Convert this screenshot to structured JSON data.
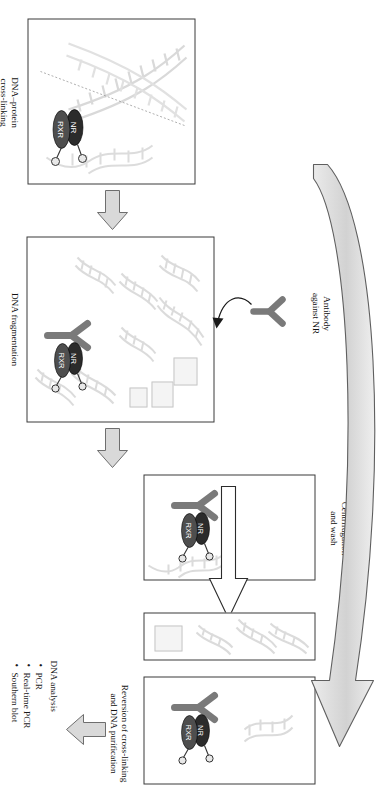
{
  "figure": {
    "orientation": "rotated-90-clockwise"
  },
  "steps": {
    "crosslinking": "DNA–protein\ncross-linking",
    "crosslinking_line1": "DNA–protein",
    "crosslinking_line2": "cross-linking",
    "fragmentation": "DNA fragmentation",
    "antibody_line1": "Antibody",
    "antibody_line2": "against NR",
    "centrifugation_line1": "Centrifugation",
    "centrifugation_line2": "and wash",
    "reversion_line1": "Reversion of cross-linking",
    "reversion_line2": "and DNA purification"
  },
  "analysis": {
    "heading": "DNA analysis",
    "items": [
      "PCR",
      "Real-time PCR",
      "Southern blot"
    ]
  },
  "complex": {
    "nr_label": "NR",
    "rxr_label": "RXR"
  },
  "icons": {
    "antibody": "antibody-y-icon",
    "dna_helix": "dna-helix-icon",
    "block_arrow": "block-arrow-icon",
    "curved_arrow": "curved-arrow-icon",
    "ligand": "ligand-circle-icon"
  },
  "colors": {
    "outline": "#3a3a3a",
    "arrow_fill": "#d9d9d9",
    "arrow_stroke": "#6b6b6b",
    "antibody": "#7a7a7a",
    "nr_oval": "#2b2b2b",
    "rxr_oval": "#4a4a4a",
    "helix": "#bdbdbd",
    "text": "#111111",
    "background": "#ffffff"
  }
}
